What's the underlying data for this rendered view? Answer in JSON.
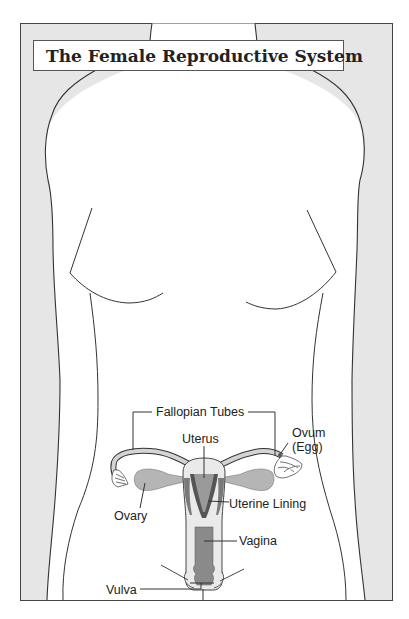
{
  "title": "The Female Reproductive System",
  "colors": {
    "background_frame": "#e6e6e6",
    "body_fill": "#ffffff",
    "outline": "#333333",
    "organ_fill": "#b5b5b5",
    "organ_dark": "#7a7a7a",
    "organ_darker": "#555555",
    "tube_fill": "#d4d4d4"
  },
  "labels": {
    "fallopian_tubes": "Fallopian Tubes",
    "uterus": "Uterus",
    "ovum_line1": "Ovum",
    "ovum_line2": "(Egg)",
    "uterine_lining": "Uterine Lining",
    "ovary": "Ovary",
    "vagina": "Vagina",
    "vulva": "Vulva"
  }
}
